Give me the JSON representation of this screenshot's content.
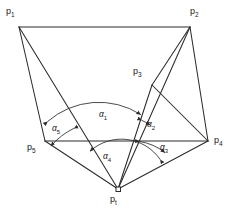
{
  "figure": {
    "stroke_color": "#2b2b2b",
    "background_color": "#ffffff",
    "points": [
      {
        "id": "p1",
        "label": "p",
        "sub": "1",
        "x": 19,
        "y": 27,
        "label_x": 6,
        "label_y": 7
      },
      {
        "id": "p2",
        "label": "p",
        "sub": "2",
        "x": 190,
        "y": 27,
        "label_x": 190,
        "label_y": 7
      },
      {
        "id": "p3",
        "label": "p",
        "sub": "3",
        "x": 152,
        "y": 85,
        "label_x": 133,
        "label_y": 67
      },
      {
        "id": "p4",
        "label": "p",
        "sub": "4",
        "x": 208,
        "y": 141,
        "label_x": 214,
        "label_y": 136
      },
      {
        "id": "p5",
        "label": "p",
        "sub": "5",
        "x": 45,
        "y": 141,
        "label_x": 27,
        "label_y": 143
      },
      {
        "id": "pt",
        "label": "p",
        "sub": "t",
        "x": 118,
        "y": 189,
        "label_x": 110,
        "label_y": 195
      }
    ],
    "angles": [
      {
        "id": "a1",
        "label": "α",
        "sub": "1",
        "label_x": 99,
        "label_y": 110,
        "radius": 78,
        "from": "p5",
        "to": "p3"
      },
      {
        "id": "a2",
        "label": "α",
        "sub": "2",
        "label_x": 147,
        "label_y": 120,
        "radius": 72,
        "from": "p3",
        "to": "p2"
      },
      {
        "id": "a3",
        "label": "α",
        "sub": "3",
        "label_x": 160,
        "label_y": 143,
        "radius": 52,
        "from": "p2",
        "to": "p4"
      },
      {
        "id": "a4",
        "label": "α",
        "sub": "4",
        "label_x": 103,
        "label_y": 152,
        "radius": 47,
        "from": "p4",
        "to": "p1"
      },
      {
        "id": "a5",
        "label": "α",
        "sub": "5",
        "label_x": 52,
        "label_y": 124,
        "radius": 72,
        "from": "p1",
        "to": "p5"
      }
    ],
    "marker": {
      "name": "viewpoint-square-marker",
      "x": 118,
      "y": 189,
      "size": 4
    }
  }
}
